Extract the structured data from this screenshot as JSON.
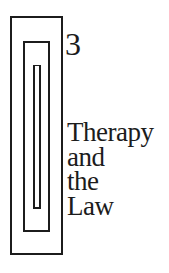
{
  "chapter": {
    "number": "3",
    "title_lines": [
      "Therapy",
      "and",
      "the",
      "Law"
    ]
  },
  "colors": {
    "ink": "#1c1c1c",
    "background": "#ffffff"
  }
}
